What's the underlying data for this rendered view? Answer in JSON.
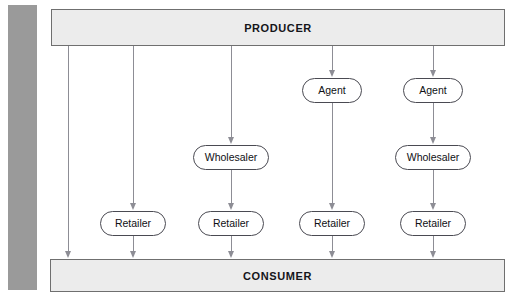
{
  "diagram": {
    "colors": {
      "gray_bar": "#9a9a9a",
      "endbox_fill": "#ececec",
      "endbox_border": "#6f6f6f",
      "node_fill": "#ffffff",
      "node_border": "#4a4a52",
      "connector": "#8d8d95",
      "text": "#101015",
      "background": "#ffffff"
    },
    "top": {
      "label": "PRODUCER"
    },
    "bottom": {
      "label": "CONSUMER"
    },
    "levels": {
      "agent": "Agent",
      "wholesaler": "Wholesaler",
      "retailer": "Retailer"
    },
    "channels": [
      {
        "index": 1,
        "name": "direct-channel",
        "x": 68,
        "path": [
          "PRODUCER",
          "CONSUMER"
        ],
        "nodes": []
      },
      {
        "index": 2,
        "name": "retailer-channel",
        "x": 133,
        "path": [
          "PRODUCER",
          "Retailer",
          "CONSUMER"
        ],
        "nodes": [
          {
            "label": "Retailer",
            "level": "retailer"
          }
        ]
      },
      {
        "index": 3,
        "name": "wholesaler-retailer-channel",
        "x": 231,
        "path": [
          "PRODUCER",
          "Wholesaler",
          "Retailer",
          "CONSUMER"
        ],
        "nodes": [
          {
            "label": "Wholesaler",
            "level": "wholesaler"
          },
          {
            "label": "Retailer",
            "level": "retailer"
          }
        ]
      },
      {
        "index": 4,
        "name": "agent-retailer-channel",
        "x": 332,
        "path": [
          "PRODUCER",
          "Agent",
          "Retailer",
          "CONSUMER"
        ],
        "nodes": [
          {
            "label": "Agent",
            "level": "agent"
          },
          {
            "label": "Retailer",
            "level": "retailer"
          }
        ]
      },
      {
        "index": 5,
        "name": "agent-wholesaler-retailer-channel",
        "x": 433,
        "path": [
          "PRODUCER",
          "Agent",
          "Wholesaler",
          "Retailer",
          "CONSUMER"
        ],
        "nodes": [
          {
            "label": "Agent",
            "level": "agent"
          },
          {
            "label": "Wholesaler",
            "level": "wholesaler"
          },
          {
            "label": "Retailer",
            "level": "retailer"
          }
        ]
      }
    ],
    "nodes": {
      "agent_1": {
        "label": "Agent",
        "x": 302,
        "y": 78,
        "width": 60
      },
      "agent_2": {
        "label": "Agent",
        "x": 403,
        "y": 78,
        "width": 60
      },
      "wholesaler_1": {
        "label": "Wholesaler",
        "x": 193,
        "y": 145,
        "width": 76
      },
      "wholesaler_2": {
        "label": "Wholesaler",
        "x": 395,
        "y": 145,
        "width": 76
      },
      "retailer_1": {
        "label": "Retailer",
        "x": 100,
        "y": 211,
        "width": 66
      },
      "retailer_2": {
        "label": "Retailer",
        "x": 198,
        "y": 211,
        "width": 66
      },
      "retailer_3": {
        "label": "Retailer",
        "x": 299,
        "y": 211,
        "width": 66
      },
      "retailer_4": {
        "label": "Retailer",
        "x": 400,
        "y": 211,
        "width": 66
      }
    }
  }
}
